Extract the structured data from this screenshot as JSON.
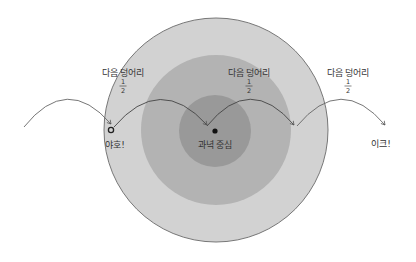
{
  "diagram": {
    "colors": {
      "background": "#ffffff",
      "outer_ring": "#d2d2d2",
      "middle_ring": "#b3b3b3",
      "inner_ring": "#999999",
      "outline": "#777777",
      "arc": "#555555",
      "text": "#333333"
    },
    "rings": [
      {
        "name": "outer",
        "cx": 216,
        "cy": 130,
        "r": 112
      },
      {
        "name": "middle",
        "cx": 216,
        "cy": 130,
        "r": 75
      },
      {
        "name": "inner",
        "cx": 215,
        "cy": 131,
        "r": 36
      }
    ],
    "chunk_labels": [
      {
        "text": "다음 덩어리",
        "fraction_num": "1",
        "fraction_den": "2",
        "x": 123,
        "y": 73
      },
      {
        "text": "다음 덩어리",
        "fraction_num": "1",
        "fraction_den": "2",
        "x": 249,
        "y": 73
      },
      {
        "text": "다음 덩어리",
        "fraction_num": "1",
        "fraction_den": "2",
        "x": 348,
        "y": 73
      }
    ],
    "points": {
      "start": {
        "label": "야호!",
        "marker": "open-circle",
        "x": 111,
        "y": 130
      },
      "center": {
        "label": "과녁 중심",
        "marker": "filled-dot",
        "x": 215,
        "y": 131
      },
      "end": {
        "label": "이크!",
        "marker": "none",
        "x": 381,
        "y": 145
      }
    },
    "arcs": [
      {
        "from": [
          24,
          127
        ],
        "to": [
          111,
          124
        ],
        "peak_y": 100
      },
      {
        "from": [
          114,
          127
        ],
        "to": [
          207,
          125
        ],
        "peak_y": 100
      },
      {
        "from": [
          207,
          126
        ],
        "to": [
          294,
          125
        ],
        "peak_y": 100
      },
      {
        "from": [
          297,
          126
        ],
        "to": [
          385,
          125
        ],
        "peak_y": 100
      }
    ]
  }
}
